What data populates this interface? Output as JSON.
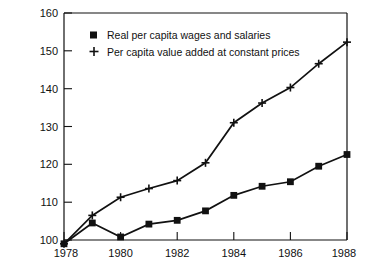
{
  "chart_data": {
    "type": "line",
    "title": "",
    "subtitle": "",
    "xlabel": "",
    "ylabel": "Indices 1978 = 100",
    "x": [
      1978,
      1979,
      1980,
      1981,
      1982,
      1983,
      1984,
      1985,
      1986,
      1987,
      1988
    ],
    "xtick_labels": [
      "1978",
      "1980",
      "1982",
      "1984",
      "1986",
      "1988"
    ],
    "xtick_values": [
      1978,
      1980,
      1982,
      1984,
      1986,
      1988
    ],
    "ytick_labels": [
      "100",
      "110",
      "120",
      "130",
      "140",
      "150",
      "160"
    ],
    "ytick_values": [
      100,
      110,
      120,
      130,
      140,
      150,
      160
    ],
    "xlim": [
      1978,
      1988
    ],
    "ylim": [
      100,
      160
    ],
    "grid": false,
    "legend_position": "upper-left-inside",
    "series": [
      {
        "name": "Real per capita wages and salaries",
        "marker": "filled-square",
        "color": "#111111",
        "values": [
          99.0,
          104.5,
          100.8,
          104.2,
          105.2,
          107.7,
          111.8,
          114.2,
          115.4,
          119.5,
          122.6
        ]
      },
      {
        "name": "Per capita value added at constant prices",
        "marker": "plus",
        "color": "#111111",
        "values": [
          99.0,
          106.5,
          111.3,
          113.6,
          115.7,
          120.4,
          131.0,
          136.2,
          140.3,
          146.6,
          152.3
        ]
      }
    ]
  },
  "legend": {
    "entries": [
      {
        "label": "Real per capita wages and salaries",
        "marker": "filled-square"
      },
      {
        "label": "Per capita value added at constant prices",
        "marker": "plus"
      }
    ]
  },
  "axes": {
    "y_title": "Indices 1978 = 100",
    "y_labels": [
      "160",
      "150",
      "140",
      "130",
      "120",
      "110",
      "100"
    ],
    "x_labels": [
      "1978",
      "1980",
      "1982",
      "1984",
      "1986",
      "1988"
    ]
  }
}
